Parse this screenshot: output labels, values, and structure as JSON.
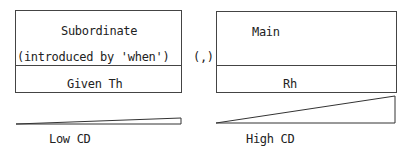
{
  "left_box": {
    "title": "Subordinate",
    "subtitle": "(introduced by 'when')",
    "bottom_label": "Given Th"
  },
  "separator": "(,)",
  "right_box": {
    "title": "Main",
    "bottom_label": "Rh"
  },
  "wedges": {
    "left_label": "Low CD",
    "right_label": "High CD"
  }
}
